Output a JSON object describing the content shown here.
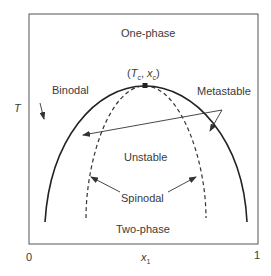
{
  "diagram": {
    "type": "phase-diagram",
    "regions": {
      "top": "One-phase",
      "center": "Unstable",
      "bottom": "Two-phase"
    },
    "curves": {
      "binodal": "Binodal",
      "spinodal": "Spinodal"
    },
    "annotations": {
      "metastable": "Metastable",
      "critical_point_T": "T",
      "critical_point_T_sub": "c",
      "critical_point_x": "x",
      "critical_point_x_sub": "c"
    },
    "axes": {
      "ylabel": "T",
      "xlabel": "x",
      "xlabel_sub": "1",
      "xmin": "0",
      "xmax": "1"
    }
  }
}
